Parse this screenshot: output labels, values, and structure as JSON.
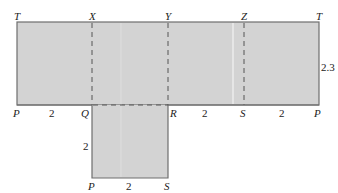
{
  "diagram": {
    "type": "net-of-prism",
    "colors": {
      "fill": "#d3d3d3",
      "stroke": "#6e6e6e",
      "dash": "#555555",
      "highlight": "#f2f2f2"
    },
    "top_labels": [
      "T",
      "X",
      "Y",
      "Z",
      "T"
    ],
    "mid_labels": [
      "P",
      "Q",
      "R",
      "S",
      "P"
    ],
    "bottom_labels": [
      "P",
      "S"
    ],
    "dimensions": {
      "PQ": "2",
      "RS": "2",
      "SP": "2",
      "height": "2.3",
      "QP_vertical": "2",
      "PS_bottom": "2"
    }
  }
}
